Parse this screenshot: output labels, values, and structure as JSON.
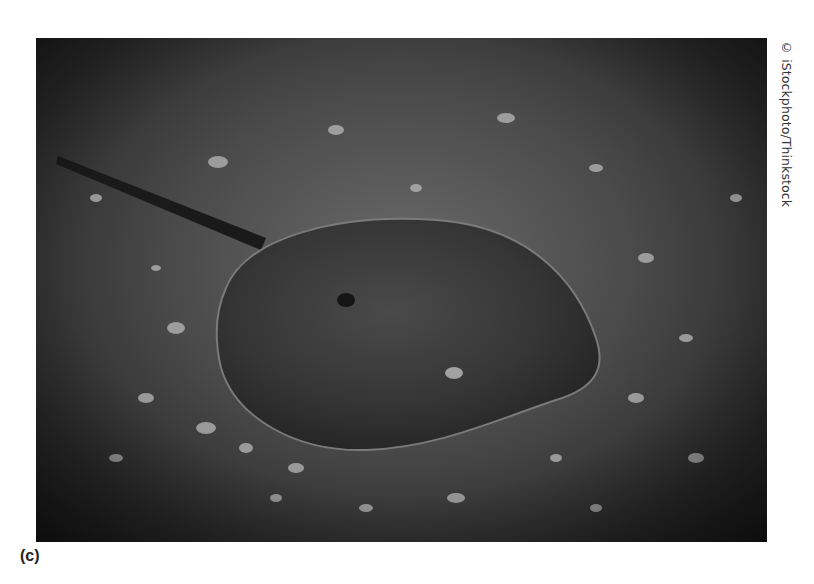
{
  "figure": {
    "panel_label": "(c)",
    "photo_credit": "© iStockphoto/Thinkstock",
    "photo": {
      "subject": "horseshoe crab on pebbly sand",
      "tone": "grayscale",
      "colors": {
        "sand_light": "#6a6a6a",
        "sand_dark": "#1c1c1c",
        "shell": "#3a3a3a",
        "shell_rim": "#8a8a8a",
        "pebble": "#bdbdbd"
      }
    }
  }
}
